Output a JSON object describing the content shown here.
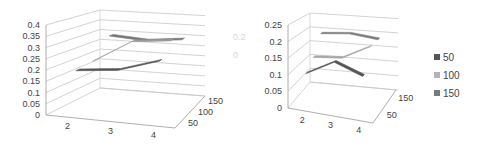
{
  "chart_data": [
    {
      "type": "line",
      "variant": "3d-line",
      "title": "",
      "xlabel": "",
      "ylabel": "",
      "categories": [
        "2",
        "3",
        "4"
      ],
      "depth_labels": [
        "50",
        "100",
        "150"
      ],
      "y_ticks": [
        "0",
        "0.05",
        "0.1",
        "0.15",
        "0.2",
        "0.25",
        "0.3",
        "0.35",
        "0.4"
      ],
      "ylim": [
        0,
        0.4
      ],
      "grid": true,
      "series": [
        {
          "name": "50",
          "color": "#555555",
          "values": [
            0.19,
            0.21,
            0.27
          ]
        },
        {
          "name": "100",
          "color": "#9a9a9a",
          "values": [
            0.2,
            0.31,
            0.33
          ]
        },
        {
          "name": "150",
          "color": "#777777",
          "values": [
            0.29,
            0.28,
            0.3
          ]
        }
      ]
    },
    {
      "type": "line",
      "variant": "3d-line",
      "title": "",
      "xlabel": "",
      "ylabel": "",
      "categories": [
        "2",
        "3",
        "4"
      ],
      "depth_labels": [
        "50",
        "150"
      ],
      "y_ticks": [
        "0",
        "0.05",
        "0.1",
        "0.15",
        "0.2",
        "0.25"
      ],
      "ylim": [
        0,
        0.25
      ],
      "grid": true,
      "legend": {
        "position": "right",
        "entries": [
          "50",
          "100",
          "150"
        ]
      },
      "series": [
        {
          "name": "50",
          "color": "#555555",
          "values": [
            0.1,
            0.15,
            0.12
          ]
        },
        {
          "name": "100",
          "color": "#a6a6a6",
          "values": [
            0.13,
            0.14,
            0.19
          ]
        },
        {
          "name": "150",
          "color": "#7a7a7a",
          "values": [
            0.19,
            0.2,
            0.19
          ]
        }
      ]
    }
  ],
  "legend": {
    "items": [
      {
        "label": "50",
        "color": "#555555"
      },
      {
        "label": "100",
        "color": "#b4b4b4"
      },
      {
        "label": "150",
        "color": "#7a7a7a"
      }
    ]
  },
  "clipped_labels": [
    "0.2",
    "0"
  ]
}
